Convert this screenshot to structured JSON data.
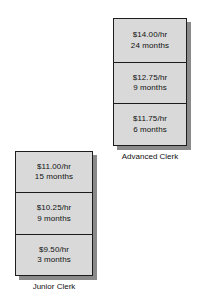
{
  "page": {
    "background_color": "#ffffff",
    "box_fill_color": "#d9d9d9",
    "box_border_color": "#1c1c1c",
    "shadow_color": "#8a8a8a",
    "text_color": "#111111"
  },
  "ladders": [
    {
      "id": "advanced-clerk",
      "caption": "Advanced Clerk",
      "steps": [
        {
          "rate": "$14.00/hr",
          "duration": "24 months"
        },
        {
          "rate": "$12.75/hr",
          "duration": "9 months"
        },
        {
          "rate": "$11.75/hr",
          "duration": "6 months"
        }
      ]
    },
    {
      "id": "junior-clerk",
      "caption": "Junior Clerk",
      "steps": [
        {
          "rate": "$11.00/hr",
          "duration": "15 months"
        },
        {
          "rate": "$10.25/hr",
          "duration": "9 months"
        },
        {
          "rate": "$9.50/hr",
          "duration": "3 months"
        }
      ]
    }
  ]
}
